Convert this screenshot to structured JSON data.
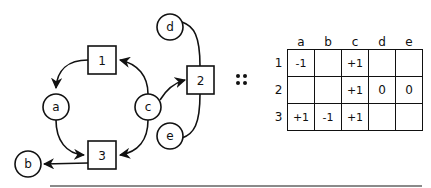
{
  "diagram": {
    "transitions": [
      {
        "id": "1",
        "label": "1"
      },
      {
        "id": "2",
        "label": "2"
      },
      {
        "id": "3",
        "label": "3"
      }
    ],
    "places": [
      {
        "id": "a",
        "label": "a"
      },
      {
        "id": "b",
        "label": "b"
      },
      {
        "id": "c",
        "label": "c"
      },
      {
        "id": "d",
        "label": "d"
      },
      {
        "id": "e",
        "label": "e"
      }
    ],
    "arcs": [
      {
        "from": "1",
        "to": "a",
        "directed": true
      },
      {
        "from": "c",
        "to": "1",
        "directed": true
      },
      {
        "from": "c",
        "to": "2",
        "directed": true
      },
      {
        "from": "a",
        "to": "3",
        "directed": true
      },
      {
        "from": "c",
        "to": "3",
        "directed": true
      },
      {
        "from": "3",
        "to": "b",
        "directed": true
      },
      {
        "from": "d",
        "to": "2",
        "directed": false
      },
      {
        "from": "e",
        "to": "2",
        "directed": false
      }
    ],
    "separator_symbol": "::"
  },
  "matrix": {
    "columns": [
      "a",
      "b",
      "c",
      "d",
      "e"
    ],
    "rows": [
      {
        "label": "1",
        "cells": [
          "-1",
          "",
          "+1",
          "",
          ""
        ]
      },
      {
        "label": "2",
        "cells": [
          "",
          "",
          "+1",
          "0",
          "0"
        ]
      },
      {
        "label": "3",
        "cells": [
          "+1",
          "-1",
          "+1",
          "",
          ""
        ]
      }
    ]
  }
}
